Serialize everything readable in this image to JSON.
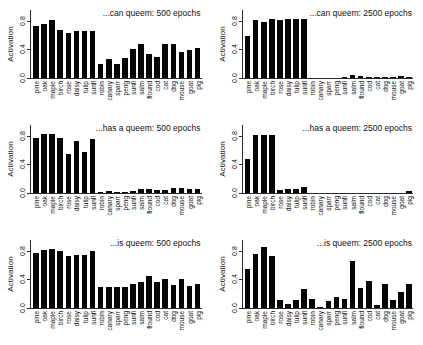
{
  "figure": {
    "axis_label_y": "Activation",
    "y_ticks": [
      "0.0",
      "0.4",
      "0.8"
    ],
    "y_min": 0,
    "y_max": 0.95,
    "bar_color": "#050505",
    "axis_color": "#2b2b2b",
    "background": "#ffffff",
    "categories": [
      "pine",
      "oak",
      "maple",
      "birch",
      "rose",
      "daisy",
      "tulip",
      "sunfl",
      "robin",
      "canary",
      "sparr",
      "peng",
      "sunfi",
      "salm",
      "flound",
      "cod",
      "cat",
      "dog",
      "mouse",
      "goat",
      "pig"
    ]
  },
  "chart_data": [
    {
      "type": "bar",
      "title": "...can queem: 500 epochs",
      "xlabel": "",
      "ylabel": "Activation",
      "ylim": [
        0,
        0.95
      ],
      "yticks": [
        0.0,
        0.4,
        0.8
      ],
      "grid": false,
      "categories": [
        "pine",
        "oak",
        "maple",
        "birch",
        "rose",
        "daisy",
        "tulip",
        "sunfl",
        "robin",
        "canary",
        "sparr",
        "peng",
        "sunfi",
        "salm",
        "flound",
        "cod",
        "cat",
        "dog",
        "mouse",
        "goat",
        "pig"
      ],
      "values": [
        0.72,
        0.76,
        0.81,
        0.67,
        0.63,
        0.65,
        0.65,
        0.66,
        0.19,
        0.27,
        0.2,
        0.28,
        0.4,
        0.48,
        0.34,
        0.3,
        0.48,
        0.48,
        0.37,
        0.39,
        0.42
      ]
    },
    {
      "type": "bar",
      "title": "...can queem: 2500 epochs",
      "xlabel": "",
      "ylabel": "Activation",
      "ylim": [
        0,
        0.95
      ],
      "yticks": [
        0.0,
        0.4,
        0.8
      ],
      "grid": false,
      "categories": [
        "pine",
        "oak",
        "maple",
        "birch",
        "rose",
        "daisy",
        "tulip",
        "sunfl",
        "robin",
        "canary",
        "sparr",
        "peng",
        "sunfi",
        "salm",
        "flound",
        "cod",
        "cat",
        "dog",
        "mouse",
        "goat",
        "pig"
      ],
      "values": [
        0.58,
        0.81,
        0.78,
        0.82,
        0.81,
        0.82,
        0.82,
        0.82,
        0.0,
        0.0,
        0.0,
        0.0,
        0.02,
        0.04,
        0.03,
        0.02,
        0.01,
        0.01,
        0.01,
        0.03,
        0.01
      ]
    },
    {
      "type": "bar",
      "title": "...has a queem: 500 epochs",
      "xlabel": "",
      "ylabel": "Activation",
      "ylim": [
        0,
        0.95
      ],
      "yticks": [
        0.0,
        0.4,
        0.8
      ],
      "grid": false,
      "categories": [
        "pine",
        "oak",
        "maple",
        "birch",
        "rose",
        "daisy",
        "tulip",
        "sunfl",
        "robin",
        "canary",
        "sparr",
        "peng",
        "sunfi",
        "salm",
        "flound",
        "cod",
        "cat",
        "dog",
        "mouse",
        "goat",
        "pig"
      ],
      "values": [
        0.77,
        0.83,
        0.82,
        0.77,
        0.55,
        0.73,
        0.57,
        0.75,
        0.02,
        0.03,
        0.02,
        0.02,
        0.03,
        0.06,
        0.05,
        0.04,
        0.04,
        0.07,
        0.07,
        0.06,
        0.06,
        0.07
      ]
    },
    {
      "type": "bar",
      "title": "...has a queem: 2500 epochs",
      "xlabel": "",
      "ylabel": "Activation",
      "ylim": [
        0,
        0.95
      ],
      "yticks": [
        0.0,
        0.4,
        0.8
      ],
      "grid": false,
      "categories": [
        "pine",
        "oak",
        "maple",
        "birch",
        "rose",
        "daisy",
        "tulip",
        "sunfl",
        "robin",
        "canary",
        "sparr",
        "peng",
        "sunfi",
        "salm",
        "flound",
        "cod",
        "cat",
        "dog",
        "mouse",
        "goat",
        "pig"
      ],
      "values": [
        0.48,
        0.81,
        0.81,
        0.81,
        0.04,
        0.06,
        0.05,
        0.08,
        0.0,
        0.0,
        0.0,
        0.0,
        0.0,
        0.0,
        0.0,
        0.0,
        0.0,
        0.0,
        0.0,
        0.0,
        0.03
      ]
    },
    {
      "type": "bar",
      "title": "...is queem: 500 epochs",
      "xlabel": "",
      "ylabel": "Activation",
      "ylim": [
        0,
        0.95
      ],
      "yticks": [
        0.0,
        0.4,
        0.8
      ],
      "grid": false,
      "categories": [
        "pine",
        "oak",
        "maple",
        "birch",
        "rose",
        "daisy",
        "tulip",
        "sunfl",
        "robin",
        "canary",
        "sparr",
        "peng",
        "sunfi",
        "salm",
        "flound",
        "cod",
        "cat",
        "dog",
        "mouse",
        "goat",
        "pig"
      ],
      "values": [
        0.77,
        0.81,
        0.83,
        0.79,
        0.72,
        0.74,
        0.74,
        0.8,
        0.3,
        0.29,
        0.29,
        0.3,
        0.34,
        0.36,
        0.45,
        0.37,
        0.41,
        0.32,
        0.41,
        0.31,
        0.34,
        0.42
      ]
    },
    {
      "type": "bar",
      "title": "...is queem: 2500 epochs",
      "xlabel": "",
      "ylabel": "Activation",
      "ylim": [
        0,
        0.95
      ],
      "yticks": [
        0.0,
        0.4,
        0.8
      ],
      "grid": false,
      "categories": [
        "pine",
        "oak",
        "maple",
        "birch",
        "rose",
        "daisy",
        "tulip",
        "sunfl",
        "robin",
        "canary",
        "sparr",
        "peng",
        "sunfi",
        "salm",
        "flound",
        "cod",
        "cat",
        "dog",
        "mouse",
        "goat",
        "pig"
      ],
      "values": [
        0.54,
        0.76,
        0.85,
        0.73,
        0.11,
        0.06,
        0.11,
        0.27,
        0.13,
        0.01,
        0.1,
        0.15,
        0.13,
        0.65,
        0.28,
        0.38,
        0.04,
        0.33,
        0.11,
        0.22,
        0.34
      ]
    }
  ]
}
